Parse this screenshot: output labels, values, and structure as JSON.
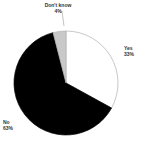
{
  "chart_data": {
    "type": "pie",
    "title": "",
    "subtitle": "",
    "xlabel": "",
    "ylabel": "",
    "legend_position": "none",
    "grid": false,
    "labels_on_slices": false,
    "start_angle_deg": 0,
    "direction": "clockwise",
    "categories": [
      "Yes",
      "No",
      "Don't know"
    ],
    "values": [
      33,
      63,
      4
    ],
    "value_suffix": "%",
    "colors": [
      "#ffffff",
      "#000000",
      "#c9c9c9"
    ],
    "slices": [
      {
        "name": "Yes",
        "value": 33,
        "value_label": "33%",
        "color": "#ffffff",
        "stroke": "#b0b0b0",
        "start_deg": 0,
        "end_deg": 118.8,
        "label_position": "right"
      },
      {
        "name": "No",
        "value": 63,
        "value_label": "63%",
        "color": "#000000",
        "stroke": "#000000",
        "start_deg": 118.8,
        "end_deg": 345.6,
        "label_position": "bottom-left"
      },
      {
        "name": "Don't know",
        "value": 4,
        "value_label": "4%",
        "color": "#c9c9c9",
        "stroke": "#b0b0b0",
        "start_deg": 345.6,
        "end_deg": 360,
        "label_position": "top"
      }
    ]
  },
  "labels": {
    "dontknow": {
      "name": "Don't know",
      "value": "4%"
    },
    "yes": {
      "name": "Yes",
      "value": "33%"
    },
    "no": {
      "name": "No",
      "value": "63%"
    }
  },
  "geometry": {
    "center_x": 66,
    "center_y": 83,
    "radius": 52
  }
}
